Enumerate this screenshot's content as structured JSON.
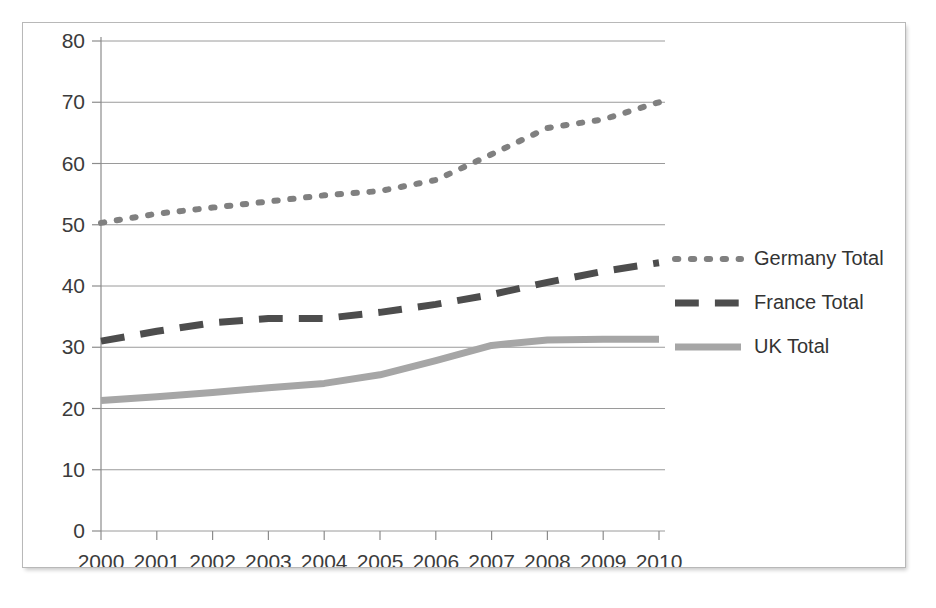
{
  "title": "",
  "chart_data": {
    "type": "line",
    "title": "",
    "xlabel": "",
    "ylabel": "",
    "x": [
      "2000",
      "2001",
      "2002",
      "2003",
      "2004",
      "2005",
      "2006",
      "2007",
      "2008",
      "2009",
      "2010"
    ],
    "xlim": [
      2000,
      2010
    ],
    "ylim": [
      0,
      80
    ],
    "yticks": [
      0,
      10,
      20,
      30,
      40,
      50,
      60,
      70,
      80
    ],
    "ytick_labels": [
      "0",
      "10",
      "20",
      "30",
      "40",
      "50",
      "60",
      "70",
      "80"
    ],
    "grid": true,
    "legend_position": "right",
    "series": [
      {
        "name": "Germany Total",
        "style": "dotted",
        "color": "#808080",
        "values": [
          50.3,
          51.8,
          52.8,
          53.8,
          54.8,
          55.5,
          57.3,
          61.5,
          65.8,
          67.2,
          70.0
        ]
      },
      {
        "name": "France Total",
        "style": "dashed",
        "color": "#4d4d4d",
        "values": [
          31.0,
          32.6,
          34.0,
          34.7,
          34.7,
          35.7,
          37.0,
          38.6,
          40.6,
          42.4,
          43.8
        ]
      },
      {
        "name": "UK Total",
        "style": "solid",
        "color": "#a6a6a6",
        "values": [
          21.3,
          21.9,
          22.6,
          23.4,
          24.1,
          25.5,
          27.8,
          30.3,
          31.2,
          31.3,
          31.3
        ]
      }
    ]
  },
  "legend": {
    "items": [
      {
        "label": "Germany Total",
        "style": "dotted",
        "color": "#808080"
      },
      {
        "label": "France Total",
        "style": "dashed",
        "color": "#4d4d4d"
      },
      {
        "label": "UK Total",
        "style": "solid",
        "color": "#a6a6a6"
      }
    ]
  }
}
